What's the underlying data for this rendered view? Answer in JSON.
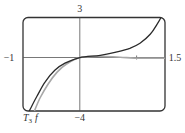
{
  "chart_data": {
    "type": "line",
    "title": "",
    "xlabel": "",
    "ylabel": "",
    "xlim": [
      -1,
      1.5
    ],
    "ylim": [
      -4,
      3
    ],
    "grid": false,
    "tick_labels": {
      "x_min": "−1",
      "x_max": "1.5",
      "y_max": "3",
      "y_min": "−4"
    },
    "x_ticks": [
      1
    ],
    "series": [
      {
        "name": "T3",
        "label": "T",
        "subscript": "3",
        "color": "#2a2a2a",
        "points": [
          [
            -0.89,
            -4.0
          ],
          [
            -0.75,
            -2.86
          ],
          [
            -0.61,
            -1.82
          ],
          [
            -0.44,
            -0.95
          ],
          [
            -0.26,
            -0.42
          ],
          [
            0,
            0
          ],
          [
            0.36,
            0.17
          ],
          [
            0.62,
            0.39
          ],
          [
            0.88,
            0.69
          ],
          [
            1.06,
            1.07
          ],
          [
            1.24,
            1.74
          ],
          [
            1.36,
            2.48
          ],
          [
            1.43,
            3.0
          ]
        ]
      },
      {
        "name": "f",
        "label": "f",
        "color": "#a8a8a8",
        "points": [
          [
            -0.8,
            -4.0
          ],
          [
            -0.7,
            -3.03
          ],
          [
            -0.56,
            -1.99
          ],
          [
            -0.4,
            -1.09
          ],
          [
            -0.24,
            -0.5
          ],
          [
            0,
            0
          ],
          [
            0.36,
            0.1
          ],
          [
            0.71,
            0.02
          ],
          [
            1.06,
            -0.05
          ],
          [
            1.5,
            -0.05
          ]
        ]
      }
    ],
    "annotations": [
      "T3",
      "f"
    ]
  },
  "labels": {
    "y_top": "3",
    "y_bottom": "−4",
    "x_left": "−1",
    "x_right": "1.5",
    "series_t3": "T",
    "series_t3_sub": "3",
    "series_f": "f"
  }
}
